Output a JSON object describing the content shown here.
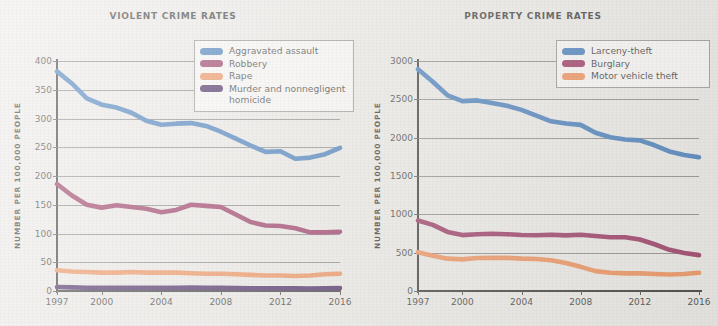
{
  "charts": [
    {
      "id": "violent",
      "title": "VIOLENT CRIME RATES",
      "ylabel": "NUMBER PER 100,000 PEOPLE",
      "legend_position": "top-right"
    },
    {
      "id": "property",
      "title": "PROPERTY CRIME RATES",
      "ylabel": "NUMBER PER 100,000 PEOPLE",
      "legend_position": "top-right"
    }
  ],
  "colors": {
    "blue": "#2c6cb3",
    "maroon": "#8d1b4c",
    "orange": "#ef8244",
    "purple": "#2d0a4e",
    "gridline": "#7d7d7d",
    "axis": "#1a1a1a",
    "background": "#eceae6"
  },
  "chart_data": [
    {
      "type": "line",
      "title": "VIOLENT CRIME RATES",
      "xlabel": "",
      "ylabel": "NUMBER PER 100,000 PEOPLE",
      "x": [
        1997,
        1998,
        1999,
        2000,
        2001,
        2002,
        2003,
        2004,
        2005,
        2006,
        2007,
        2008,
        2009,
        2010,
        2011,
        2012,
        2013,
        2014,
        2015,
        2016
      ],
      "xticks": [
        1997,
        2000,
        2004,
        2008,
        2012,
        2016
      ],
      "xlim": [
        1997,
        2016
      ],
      "ylim": [
        0,
        400
      ],
      "yticks": [
        0,
        50,
        100,
        150,
        200,
        250,
        300,
        350,
        400
      ],
      "grid": true,
      "legend": [
        "Aggravated assault",
        "Robbery",
        "Rape",
        "Murder and nonnegligent\nhomicide"
      ],
      "series": [
        {
          "name": "Aggravated assault",
          "color": "#2c6cb3",
          "values": [
            382,
            361,
            335,
            324,
            319,
            310,
            296,
            289,
            291,
            292,
            287,
            277,
            265,
            253,
            242,
            243,
            230,
            232,
            238,
            249
          ]
        },
        {
          "name": "Robbery",
          "color": "#8d1b4c",
          "values": [
            186,
            166,
            150,
            145,
            149,
            146,
            143,
            137,
            141,
            150,
            148,
            146,
            133,
            120,
            114,
            113,
            109,
            102,
            102,
            103
          ]
        },
        {
          "name": "Rape",
          "color": "#ef8244",
          "values": [
            36,
            34,
            33,
            32,
            32,
            33,
            32,
            32,
            32,
            31,
            30,
            30,
            29,
            28,
            27,
            27,
            26,
            27,
            29,
            30
          ]
        },
        {
          "name": "Murder and nonnegligent homicide",
          "color": "#2d0a4e",
          "values": [
            7,
            6.3,
            5.7,
            5.5,
            5.6,
            5.6,
            5.7,
            5.5,
            5.6,
            5.8,
            5.7,
            5.4,
            5.0,
            4.8,
            4.7,
            4.7,
            4.5,
            4.4,
            4.9,
            5.3
          ]
        }
      ]
    },
    {
      "type": "line",
      "title": "PROPERTY CRIME RATES",
      "xlabel": "",
      "ylabel": "NUMBER PER 100,000 PEOPLE",
      "x": [
        1997,
        1998,
        1999,
        2000,
        2001,
        2002,
        2003,
        2004,
        2005,
        2006,
        2007,
        2008,
        2009,
        2010,
        2011,
        2012,
        2013,
        2014,
        2015,
        2016
      ],
      "xticks": [
        1997,
        2000,
        2004,
        2008,
        2012,
        2016
      ],
      "xlim": [
        1997,
        2016
      ],
      "ylim": [
        0,
        3000
      ],
      "yticks": [
        0,
        500,
        1000,
        1500,
        2000,
        2500,
        3000
      ],
      "grid": true,
      "legend": [
        "Larceny-theft",
        "Burglary",
        "Motor vehicle theft"
      ],
      "series": [
        {
          "name": "Larceny-theft",
          "color": "#2c6cb3",
          "values": [
            2892,
            2730,
            2551,
            2477,
            2486,
            2451,
            2416,
            2362,
            2287,
            2213,
            2185,
            2167,
            2064,
            2005,
            1976,
            1965,
            1901,
            1821,
            1775,
            1745
          ]
        },
        {
          "name": "Burglary",
          "color": "#8d1b4c",
          "values": [
            919,
            863,
            771,
            729,
            741,
            747,
            741,
            730,
            727,
            733,
            726,
            733,
            718,
            701,
            702,
            672,
            610,
            537,
            495,
            468
          ]
        },
        {
          "name": "Motor vehicle theft",
          "color": "#ef8244",
          "values": [
            506,
            460,
            422,
            412,
            431,
            432,
            433,
            422,
            417,
            400,
            364,
            315,
            259,
            239,
            230,
            230,
            222,
            216,
            222,
            237
          ]
        }
      ]
    }
  ]
}
